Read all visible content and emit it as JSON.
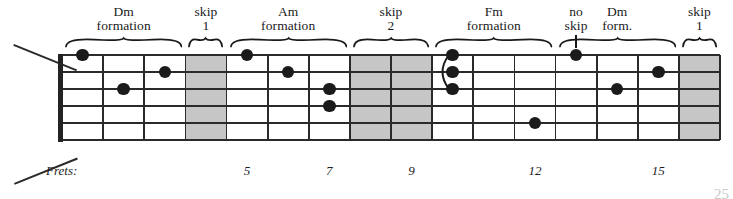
{
  "figure": {
    "frets_caption": "Frets:",
    "page_number": "25"
  },
  "annotations": [
    {
      "id": "dm-1",
      "line1": "Dm",
      "line2": "formation",
      "marker": "brace",
      "start_fret": 1,
      "end_fret": 3
    },
    {
      "id": "skip-1",
      "line1": "skip",
      "line2": "1",
      "marker": "brace",
      "start_fret": 4,
      "end_fret": 4
    },
    {
      "id": "am",
      "line1": "Am",
      "line2": "formation",
      "marker": "brace",
      "start_fret": 5,
      "end_fret": 7
    },
    {
      "id": "skip-2",
      "line1": "skip",
      "line2": "2",
      "marker": "brace",
      "start_fret": 8,
      "end_fret": 9
    },
    {
      "id": "fm",
      "line1": "Fm",
      "line2": "formation",
      "marker": "brace",
      "start_fret": 10,
      "end_fret": 12
    },
    {
      "id": "noskip",
      "line1": "no",
      "line2": "skip",
      "marker": "tick",
      "start_fret": 13,
      "end_fret": 13
    },
    {
      "id": "dm-2",
      "line1": "Dm",
      "line2": "form.",
      "marker": "brace",
      "start_fret": 13,
      "end_fret": 15
    },
    {
      "id": "skip-3",
      "line1": "skip",
      "line2": "1",
      "marker": "brace",
      "start_fret": 16,
      "end_fret": 16
    }
  ],
  "fretboard": {
    "string_count": 6,
    "fret_count": 16,
    "shaded_frets": [
      4,
      8,
      9,
      16
    ],
    "fret_numbers": [
      {
        "label": "5",
        "fret": 5
      },
      {
        "label": "7",
        "fret": 7
      },
      {
        "label": "9",
        "fret": 9
      },
      {
        "label": "12",
        "fret": 12
      },
      {
        "label": "15",
        "fret": 15
      }
    ],
    "dots": [
      {
        "fret": 1,
        "string": 1
      },
      {
        "fret": 3,
        "string": 2
      },
      {
        "fret": 2,
        "string": 3
      },
      {
        "fret": 5,
        "string": 1
      },
      {
        "fret": 6,
        "string": 2
      },
      {
        "fret": 7,
        "string": 3
      },
      {
        "fret": 7,
        "string": 4
      },
      {
        "fret": 10,
        "string": 1
      },
      {
        "fret": 10,
        "string": 2
      },
      {
        "fret": 10,
        "string": 3
      },
      {
        "fret": 12,
        "string": 5
      },
      {
        "fret": 13,
        "string": 1
      },
      {
        "fret": 15,
        "string": 2
      },
      {
        "fret": 14,
        "string": 3
      }
    ],
    "barres": [
      {
        "fret": 10,
        "string_from": 1,
        "string_to": 3
      }
    ]
  },
  "colors": {
    "line": "#2a2a2a",
    "shade": "#c6c6c6",
    "dot": "#1b1b1b",
    "text": "#1a1a1a",
    "background": "#ffffff"
  }
}
